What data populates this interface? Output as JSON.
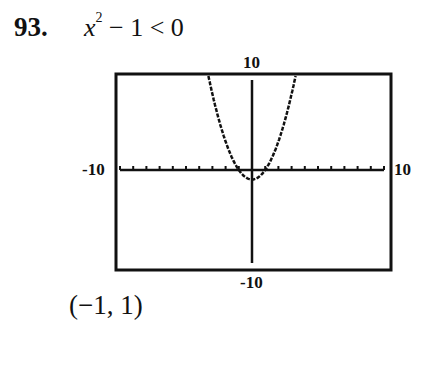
{
  "problem": {
    "number": "93.",
    "inequality_var": "x",
    "inequality_exp": "2",
    "inequality_rest": " − 1 < 0"
  },
  "graph": {
    "ymax_label": "10",
    "ymin_label": "-10",
    "xmin_label": "-10",
    "xmax_label": "10"
  },
  "answer": "(−1, 1)",
  "chart_data": {
    "type": "line",
    "function": "y = x^2 - 1",
    "xlim": [
      -10,
      10
    ],
    "ylim": [
      -10,
      10
    ],
    "xscale_ticks": 1,
    "series": [
      {
        "name": "y = x^2 - 1",
        "x": [
          -3.3,
          -3,
          -2,
          -1,
          0,
          1,
          2,
          3,
          3.3
        ],
        "y": [
          9.89,
          8,
          3,
          0,
          -1,
          0,
          3,
          8,
          9.89
        ]
      }
    ],
    "tick_labels": {
      "xmin": "-10",
      "xmax": "10",
      "ymin": "-10",
      "ymax": "10"
    },
    "grid": false,
    "solution_interval": "(-1, 1)"
  }
}
